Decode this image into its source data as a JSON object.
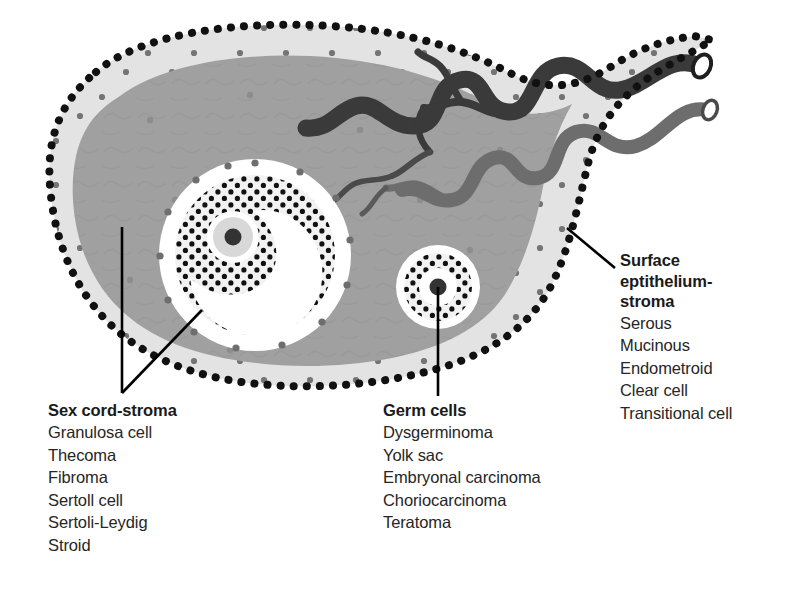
{
  "figure": {
    "background": "#ffffff"
  },
  "colors": {
    "medulla": "#a0a0a0",
    "cortex": "#e3e3e3",
    "epithelium_dots": "#111111",
    "stroma_dots": "#6e6e6e",
    "vessel_dark": "#3a3a3a",
    "vessel_mid": "#6d6d6d",
    "follicle_white": "#ffffff",
    "granulosa_dots": "#111111",
    "oocyte_nucleus": "#333333",
    "leader_line": "#000000",
    "text": "#262626",
    "heading": "#1a1a1a"
  },
  "anatomy": {
    "outer_border": "surface-epithelium-dotted-outline",
    "cortex_band": "cortex",
    "medulla_region": "medulla",
    "large_follicle": "graafian-follicle-with-antrum",
    "small_follicle": "primordial-follicle",
    "vessels": "hilar-blood-vessels",
    "oocyte": "oocyte-with-nucleus"
  },
  "labels": {
    "sex_cord": {
      "heading": "Sex cord-stroma",
      "items": [
        "Granulosa cell",
        "Thecoma",
        "Fibroma",
        "Sertoll cell",
        "Sertoli-Leydig",
        "Stroid"
      ]
    },
    "germ_cells": {
      "heading": "Germ cells",
      "items": [
        "Dysgerminoma",
        "Yolk sac",
        "Embryonal carcinoma",
        "Choriocarcinoma",
        "Teratoma"
      ]
    },
    "surface": {
      "heading_lines": [
        "Surface",
        "eptithelium-",
        "stroma"
      ],
      "items": [
        "Serous",
        "Mucinous",
        "Endometroid",
        "Clear cell",
        "Transitional cell"
      ]
    }
  }
}
